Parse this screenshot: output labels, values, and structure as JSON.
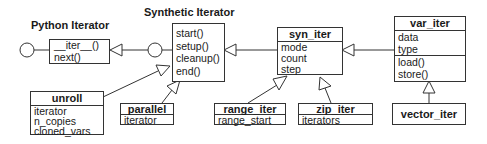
{
  "diagram": {
    "python_iterator": {
      "title": "Python Iterator",
      "methods": [
        "__iter__()",
        "next()"
      ]
    },
    "synthetic_iterator": {
      "title": "Synthetic Iterator",
      "methods": [
        "start()",
        "setup()",
        "cleanup()",
        "end()"
      ]
    },
    "syn_iter": {
      "name": "syn_iter",
      "attributes": [
        "mode",
        "count",
        "step"
      ]
    },
    "var_iter": {
      "name": "var_iter",
      "attributes": [
        "data",
        "type"
      ],
      "methods": [
        "load()",
        "store()"
      ]
    },
    "vector_iter": {
      "name": "vector_iter"
    },
    "unroll": {
      "name": "unroll",
      "attributes": [
        "iterator",
        "n_copies",
        "cloned_vars"
      ]
    },
    "parallel": {
      "name": "parallel",
      "attributes": [
        "iterator"
      ]
    },
    "range_iter": {
      "name": "range_iter",
      "attributes": [
        "range_start"
      ]
    },
    "zip_iter": {
      "name": "zip_iter",
      "attributes": [
        "iterators"
      ]
    },
    "relations": [
      {
        "from": "synthetic_iterator",
        "to": "python_iterator",
        "type": "realization"
      },
      {
        "from": "syn_iter",
        "to": "synthetic_iterator",
        "type": "generalization"
      },
      {
        "from": "var_iter",
        "to": "syn_iter",
        "type": "generalization"
      },
      {
        "from": "vector_iter",
        "to": "var_iter",
        "type": "generalization"
      },
      {
        "from": "unroll",
        "to": "synthetic_iterator",
        "type": "generalization"
      },
      {
        "from": "parallel",
        "to": "synthetic_iterator",
        "type": "generalization"
      },
      {
        "from": "range_iter",
        "to": "syn_iter",
        "type": "generalization"
      },
      {
        "from": "zip_iter",
        "to": "syn_iter",
        "type": "generalization"
      }
    ],
    "colors": {
      "line": "#333333",
      "background": "#ffffff",
      "text": "#1a1a1a"
    }
  }
}
